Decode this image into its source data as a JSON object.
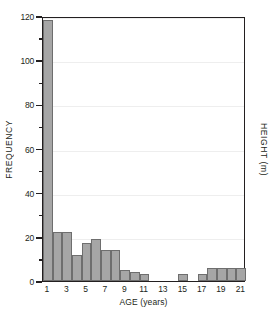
{
  "chart_data": {
    "type": "bar",
    "title": "",
    "xlabel": "AGE (years)",
    "ylabel": "FREQUENCY",
    "y2label": "HEIGHT (m)",
    "grid": true,
    "legend": null,
    "xlim": [
      0.5,
      21.5
    ],
    "ylim": [
      0,
      120
    ],
    "bar_color": "#a6a6a6",
    "bar_edge_color": "#6e6e6e",
    "axis_color": "#231f20",
    "grid_color": "#eeeeee",
    "categories": [
      1,
      2,
      3,
      4,
      5,
      6,
      7,
      8,
      9,
      10,
      11,
      12,
      13,
      14,
      15,
      16,
      17,
      18,
      19,
      20,
      21
    ],
    "values": [
      118,
      22,
      22,
      12,
      17,
      19,
      14,
      14,
      5,
      4,
      3,
      0,
      0,
      0,
      3,
      0,
      3,
      6,
      6,
      6,
      6
    ],
    "xticks": [
      1,
      3,
      5,
      7,
      9,
      11,
      13,
      15,
      17,
      19,
      21
    ],
    "xticklabels": [
      "1",
      "3",
      "5",
      "7",
      "9",
      "11",
      "13",
      "15",
      "17",
      "19",
      "21"
    ],
    "yticks": [
      0,
      20,
      40,
      60,
      80,
      100,
      120
    ],
    "yticklabels": [
      "0",
      "20",
      "40",
      "60",
      "80",
      "100",
      "120"
    ],
    "yminorticks": [
      10,
      30,
      50,
      70,
      90,
      110
    ]
  }
}
